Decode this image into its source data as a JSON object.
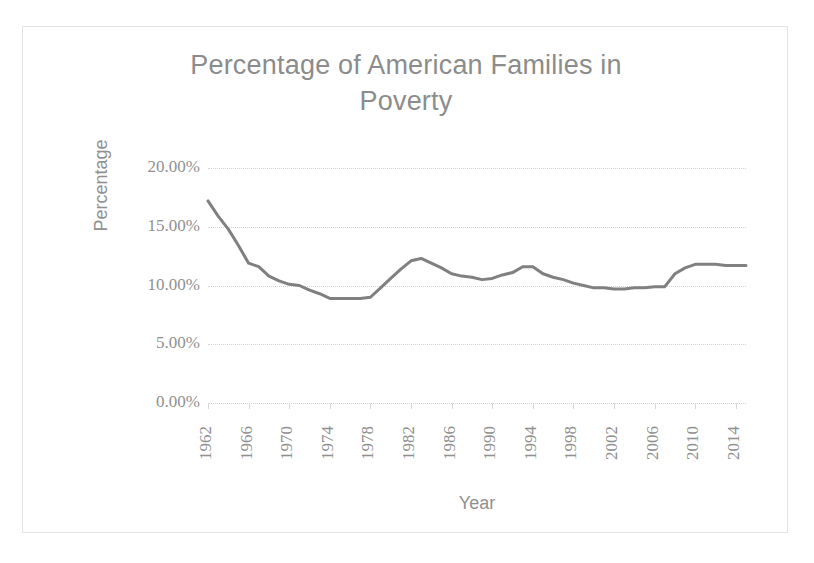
{
  "chart_data": {
    "type": "line",
    "title": "Percentage of American Families in Poverty",
    "title_line1": "Percentage of American Families in",
    "title_line2": "Poverty",
    "xlabel": "Year",
    "ylabel": "Percentage",
    "ylim": [
      0,
      20
    ],
    "xlim": [
      1962,
      2015
    ],
    "grid": true,
    "legend": false,
    "line_color": "#808080",
    "ytick_labels": [
      "20.00%",
      "15.00%",
      "10.00%",
      "5.00%",
      "0.00%"
    ],
    "ytick_values": [
      20,
      15,
      10,
      5,
      0
    ],
    "xtick_labels": [
      "1962",
      "1966",
      "1970",
      "1974",
      "1978",
      "1982",
      "1986",
      "1990",
      "1994",
      "1998",
      "2002",
      "2006",
      "2010",
      "2014"
    ],
    "xtick_values": [
      1962,
      1966,
      1970,
      1974,
      1978,
      1982,
      1986,
      1990,
      1994,
      1998,
      2002,
      2006,
      2010,
      2014
    ],
    "series": [
      {
        "name": "Percentage of American Families in Poverty",
        "x": [
          1962,
          1963,
          1964,
          1965,
          1966,
          1967,
          1968,
          1969,
          1970,
          1971,
          1972,
          1973,
          1974,
          1975,
          1976,
          1977,
          1978,
          1979,
          1980,
          1981,
          1982,
          1983,
          1984,
          1985,
          1986,
          1987,
          1988,
          1989,
          1990,
          1991,
          1992,
          1993,
          1994,
          1995,
          1996,
          1997,
          1998,
          1999,
          2000,
          2001,
          2002,
          2003,
          2004,
          2005,
          2006,
          2007,
          2008,
          2009,
          2010,
          2011,
          2012,
          2013,
          2014,
          2015
        ],
        "values": [
          17.2,
          15.9,
          14.8,
          13.4,
          11.9,
          11.6,
          10.8,
          10.4,
          10.1,
          10.0,
          9.6,
          9.3,
          8.9,
          8.9,
          8.9,
          8.9,
          9.0,
          9.8,
          10.6,
          11.4,
          12.1,
          12.3,
          11.9,
          11.5,
          11.0,
          10.8,
          10.7,
          10.5,
          10.6,
          10.9,
          11.1,
          11.6,
          11.6,
          11.0,
          10.7,
          10.5,
          10.2,
          10.0,
          9.8,
          9.8,
          9.7,
          9.7,
          9.8,
          9.8,
          9.9,
          9.9,
          11.0,
          11.5,
          11.8,
          11.8,
          11.8,
          11.7,
          11.7,
          11.7
        ]
      }
    ]
  }
}
